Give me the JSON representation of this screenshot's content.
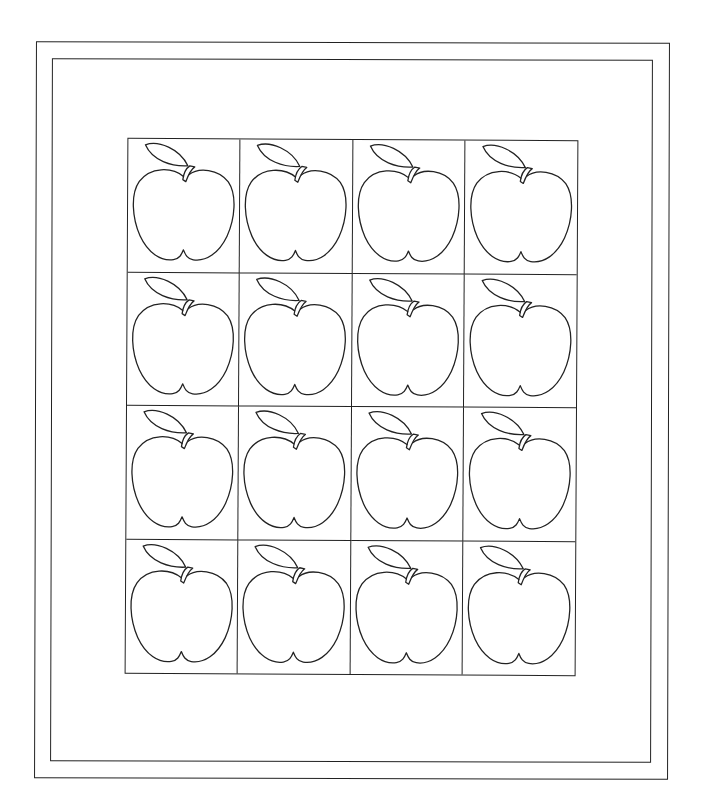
{
  "worksheet": {
    "grid": {
      "rows": 4,
      "columns": 4
    },
    "item": "apple",
    "count": 16,
    "colors": {
      "line": "#222222",
      "background": "#ffffff"
    }
  }
}
